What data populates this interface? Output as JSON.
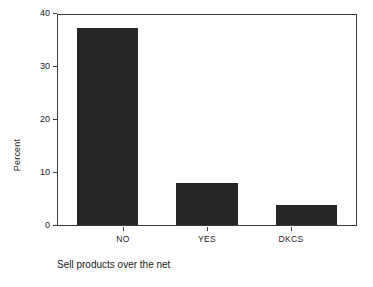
{
  "chart_data": {
    "type": "bar",
    "title": "",
    "subtitle": "",
    "caption": "Sell products over the net",
    "categories": [
      "NO",
      "YES",
      "DKCS"
    ],
    "values": [
      37.5,
      8.0,
      3.8
    ],
    "xlabel": "",
    "ylabel": "Percent",
    "ylim": [
      0,
      40
    ],
    "yticks": [
      0,
      10,
      20,
      30,
      40
    ],
    "ytick_labels": [
      "0",
      "10",
      "20",
      "30",
      "40"
    ],
    "grid": false,
    "legend": false,
    "legend_position": "none",
    "bar_color": "#262626",
    "axis_color": "#3a3a3a",
    "background_color": "#ffffff"
  },
  "axes": {
    "y_title": "Percent",
    "y_ticks": [
      {
        "value": 40,
        "label": "40"
      },
      {
        "value": 30,
        "label": "30"
      },
      {
        "value": 20,
        "label": "20"
      },
      {
        "value": 10,
        "label": "10"
      },
      {
        "value": 0,
        "label": "0"
      }
    ],
    "x_ticks": [
      {
        "label": "NO"
      },
      {
        "label": "YES"
      },
      {
        "label": "DKCS"
      }
    ]
  },
  "footer": {
    "caption": "Sell products over the net"
  }
}
